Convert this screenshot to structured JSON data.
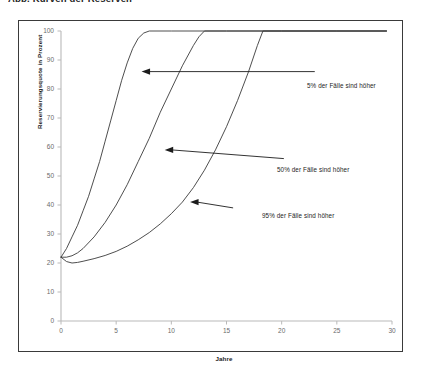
{
  "document": {
    "heading": "Abb. Kurven der Reserven"
  },
  "chart_data": {
    "type": "line",
    "title": "",
    "subtitle": "",
    "xlabel": "Jahre",
    "ylabel": "Reservierungsquote in Prozent",
    "xlim": [
      0,
      30
    ],
    "ylim": [
      0,
      100
    ],
    "xticks": [
      0,
      5,
      10,
      15,
      20,
      25,
      30
    ],
    "yticks": [
      0,
      10,
      20,
      30,
      40,
      50,
      60,
      70,
      80,
      90,
      100
    ],
    "xtick_labels": [
      "0",
      "5",
      "10",
      "15",
      "20",
      "25",
      "30"
    ],
    "ytick_labels": [
      "0",
      "10",
      "20",
      "30",
      "40",
      "50",
      "60",
      "70",
      "80",
      "90",
      "100"
    ],
    "grid": false,
    "legend_position": "none",
    "line_color": "#3a3a3a",
    "series": [
      {
        "name": "5% der Fälle sind höher",
        "x": [
          0,
          0.5,
          1,
          1.5,
          2,
          2.5,
          3,
          3.5,
          4,
          4.5,
          5,
          5.5,
          6,
          6.5,
          7,
          7.5,
          8,
          10,
          15,
          20,
          25,
          29.5
        ],
        "values": [
          22,
          25,
          29,
          33,
          38,
          43,
          49,
          55,
          62,
          69,
          76,
          83,
          89,
          94,
          97.5,
          99.3,
          100,
          100,
          100,
          100,
          100,
          100
        ]
      },
      {
        "name": "50% der Fälle sind höher",
        "x": [
          0,
          0.5,
          1,
          1.5,
          2,
          3,
          4,
          5,
          6,
          7,
          8,
          9,
          10,
          11,
          12,
          12.5,
          13,
          15,
          20,
          25,
          29.5
        ],
        "values": [
          22,
          22,
          22.5,
          23.5,
          25,
          29,
          34,
          40,
          47,
          55,
          63,
          72,
          80,
          88,
          95,
          98,
          100,
          100,
          100,
          100,
          100
        ]
      },
      {
        "name": "95% der Fälle sind höher",
        "x": [
          0,
          0.5,
          1,
          1.5,
          2,
          3,
          4,
          5,
          6,
          7,
          8,
          9,
          10,
          11,
          12,
          13,
          14,
          15,
          16,
          17,
          17.8,
          18.3,
          20,
          25,
          29.5
        ],
        "values": [
          22,
          20.5,
          20,
          20.2,
          20.6,
          21.5,
          22.6,
          24,
          25.8,
          28,
          30.5,
          33.5,
          37,
          41,
          46,
          52,
          59,
          67,
          76,
          86,
          95,
          100,
          100,
          100,
          100
        ]
      }
    ],
    "annotations": [
      {
        "text": "5% der Fälle sind höher",
        "target_x": 7.3,
        "target_y": 86,
        "label_x": 23.0,
        "label_y": 86
      },
      {
        "text": "50% der Fälle sind höher",
        "target_x": 9.4,
        "target_y": 59,
        "label_x": 20.2,
        "label_y": 56
      },
      {
        "text": "95% der Fälle sind höher",
        "target_x": 11.7,
        "target_y": 41,
        "label_x": 15.6,
        "label_y": 39
      }
    ]
  }
}
